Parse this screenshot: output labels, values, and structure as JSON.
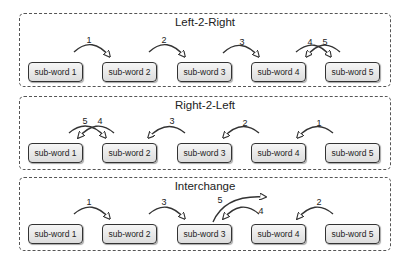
{
  "panels": [
    {
      "title": "Left-2-Right",
      "boxes": [
        "sub-word 1",
        "sub-word 2",
        "sub-word 3",
        "sub-word 4",
        "sub-word 5"
      ],
      "arrows": [
        {
          "label": "1",
          "from": "sub-word 1",
          "to": "sub-word 2"
        },
        {
          "label": "2",
          "from": "sub-word 2",
          "to": "sub-word 3"
        },
        {
          "label": "3",
          "from": "sub-word 3",
          "to": "sub-word 4"
        },
        {
          "label": "4",
          "from": "sub-word 5",
          "to": "sub-word 4"
        },
        {
          "label": "5",
          "from": "sub-word 4",
          "to": "sub-word 5"
        }
      ]
    },
    {
      "title": "Right-2-Left",
      "boxes": [
        "sub-word 1",
        "sub-word 2",
        "sub-word 3",
        "sub-word 4",
        "sub-word 5"
      ],
      "arrows": [
        {
          "label": "1",
          "from": "sub-word 5",
          "to": "sub-word 4"
        },
        {
          "label": "2",
          "from": "sub-word 4",
          "to": "sub-word 3"
        },
        {
          "label": "3",
          "from": "sub-word 3",
          "to": "sub-word 2"
        },
        {
          "label": "4",
          "from": "sub-word 1",
          "to": "sub-word 2"
        },
        {
          "label": "5",
          "from": "sub-word 2",
          "to": "sub-word 1"
        }
      ]
    },
    {
      "title": "Interchange",
      "boxes": [
        "sub-word 1",
        "sub-word 2",
        "sub-word 3",
        "sub-word 4",
        "sub-word 5"
      ],
      "arrows": [
        {
          "label": "1",
          "from": "sub-word 1",
          "to": "sub-word 2"
        },
        {
          "label": "2",
          "from": "sub-word 5",
          "to": "sub-word 4"
        },
        {
          "label": "3",
          "from": "sub-word 2",
          "to": "sub-word 3"
        },
        {
          "label": "4",
          "from": "sub-word 4",
          "to": "sub-word 3"
        },
        {
          "label": "5",
          "from": "sub-word 3",
          "to": "beyond sub-word 3"
        }
      ]
    }
  ]
}
